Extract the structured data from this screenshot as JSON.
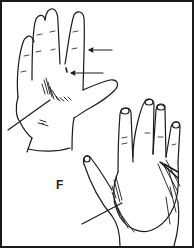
{
  "figure": {
    "panel_label": "F",
    "subjects": [
      {
        "name": "left-hand-palm",
        "view": "palmar"
      },
      {
        "name": "right-hand-dorsum",
        "view": "dorsal"
      }
    ],
    "annotations": [
      {
        "type": "arrow",
        "target": "ring-finger-edge"
      },
      {
        "type": "arrow",
        "target": "finger-web-space"
      },
      {
        "type": "pointer-line",
        "target": "palm-shaded-region"
      },
      {
        "type": "pointer-line",
        "target": "dorsum-shaded-region"
      }
    ],
    "colors": {
      "ink": "#1a1a1a",
      "background": "#ffffff"
    }
  }
}
